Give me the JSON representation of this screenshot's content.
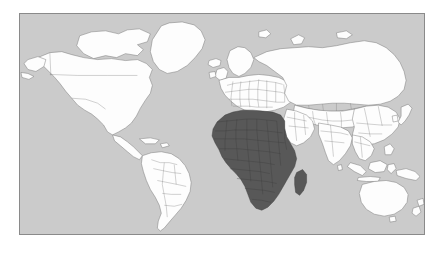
{
  "figure": {
    "kind": "world-map",
    "projection": "equirectangular",
    "frame": {
      "stroke_color": "#8a8a8a",
      "x": 19,
      "y": 13,
      "width": 406,
      "height": 222
    },
    "page_background": "#ffffff",
    "ocean_color": "#cbcbcb",
    "land_color": "#fdfdfd",
    "land_border_color": "#6f6f6f",
    "highlight_color": "#585858",
    "highlight_border_color": "#3c3c3c"
  },
  "chart_data": {
    "type": "map",
    "title": "",
    "subtitle": "",
    "xlabel": "",
    "ylabel": "",
    "legend": [],
    "annotations": [],
    "grid": false,
    "categories": [
      "highlighted",
      "not-highlighted"
    ],
    "values": [
      1,
      0
    ],
    "regions": [
      {
        "name": "Africa",
        "highlighted": true,
        "value": 1,
        "color": "#585858"
      },
      {
        "name": "Madagascar",
        "highlighted": true,
        "value": 1,
        "color": "#585858"
      },
      {
        "name": "North America",
        "highlighted": false,
        "value": 0,
        "color": "#fdfdfd"
      },
      {
        "name": "South America",
        "highlighted": false,
        "value": 0,
        "color": "#fdfdfd"
      },
      {
        "name": "Greenland",
        "highlighted": false,
        "value": 0,
        "color": "#fdfdfd"
      },
      {
        "name": "Europe",
        "highlighted": false,
        "value": 0,
        "color": "#fdfdfd"
      },
      {
        "name": "Asia",
        "highlighted": false,
        "value": 0,
        "color": "#fdfdfd"
      },
      {
        "name": "Middle East",
        "highlighted": false,
        "value": 0,
        "color": "#fdfdfd"
      },
      {
        "name": "India",
        "highlighted": false,
        "value": 0,
        "color": "#fdfdfd"
      },
      {
        "name": "Southeast Asia Islands",
        "highlighted": false,
        "value": 0,
        "color": "#fdfdfd"
      },
      {
        "name": "Australia",
        "highlighted": false,
        "value": 0,
        "color": "#fdfdfd"
      },
      {
        "name": "New Zealand",
        "highlighted": false,
        "value": 0,
        "color": "#fdfdfd"
      },
      {
        "name": "Japan",
        "highlighted": false,
        "value": 0,
        "color": "#fdfdfd"
      },
      {
        "name": "Iceland",
        "highlighted": false,
        "value": 0,
        "color": "#fdfdfd"
      },
      {
        "name": "British Isles",
        "highlighted": false,
        "value": 0,
        "color": "#fdfdfd"
      }
    ]
  }
}
